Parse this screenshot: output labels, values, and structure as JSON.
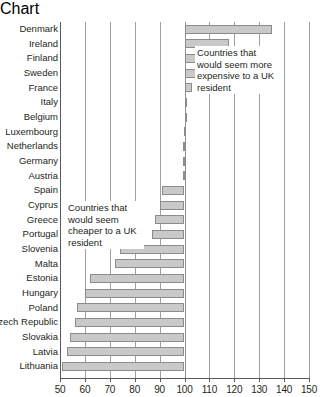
{
  "chart_data": {
    "type": "bar",
    "orientation": "horizontal",
    "title": "",
    "xlabel": "",
    "ylabel": "",
    "xlim": [
      50,
      150
    ],
    "xticks": [
      50,
      60,
      70,
      80,
      90,
      100,
      110,
      120,
      130,
      140,
      150
    ],
    "baseline": 100,
    "grid": true,
    "legend": null,
    "categories": [
      "Denmark",
      "Ireland",
      "Finland",
      "Sweden",
      "France",
      "Italy",
      "Belgium",
      "Luxembourg",
      "Netherlands",
      "Germany",
      "Austria",
      "Spain",
      "Cyprus",
      "Greece",
      "Portugal",
      "Slovenia",
      "Malta",
      "Estonia",
      "Hungary",
      "Poland",
      "Czech Republic",
      "Slovakia",
      "Latvia",
      "Lithuania"
    ],
    "values": [
      135,
      118,
      117,
      108,
      103,
      100.5,
      100.4,
      99.6,
      99.5,
      99.4,
      99.2,
      91,
      90,
      88,
      87,
      74,
      72,
      62,
      60,
      57,
      56,
      54,
      53,
      51
    ],
    "annotations": [
      {
        "id": "expensive",
        "text": "Countries that would seem more expensive to a UK resident"
      },
      {
        "id": "cheaper",
        "text": "Countries that would seem cheaper to a UK resident"
      }
    ],
    "colors": {
      "bar_fill": "#c9c9c9",
      "bar_border": "#8c8c8c",
      "gridline": "#9aa0a6",
      "axis": "#58595b",
      "text": "#231f20",
      "background": "#ffffff"
    }
  }
}
